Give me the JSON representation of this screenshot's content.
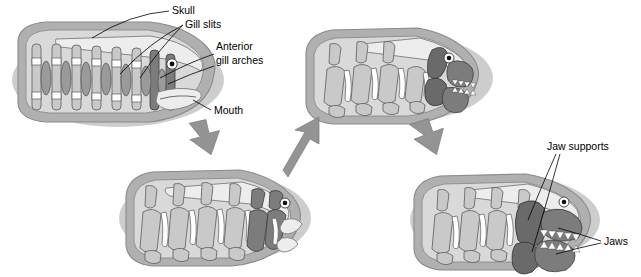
{
  "figure": {
    "type": "scientific-diagram",
    "background_color": "#ffffff",
    "palette": {
      "body_outer": "#b0b0b0",
      "body_inner": "#d9d9d9",
      "skull": "#ededed",
      "arch_light": "#c9c9c9",
      "arch_mid": "#b4b4b4",
      "arch_dark": "#7c7c7c",
      "gill_slit": "#ffffff",
      "arrow": "#949494",
      "label_text": "#000000"
    }
  },
  "labels": [
    {
      "id": "skull",
      "text": "Skull",
      "x": 172,
      "y": 14,
      "anchor": "start"
    },
    {
      "id": "gill-slits",
      "text": "Gill slits",
      "x": 185,
      "y": 28,
      "anchor": "start"
    },
    {
      "id": "anterior-1",
      "text": "Anterior",
      "x": 216,
      "y": 50,
      "anchor": "start"
    },
    {
      "id": "anterior-2",
      "text": "gill arches",
      "x": 216,
      "y": 64,
      "anchor": "start"
    },
    {
      "id": "mouth",
      "text": "Mouth",
      "x": 214,
      "y": 114,
      "anchor": "start"
    },
    {
      "id": "jaw-supports",
      "text": "Jaw supports",
      "x": 547,
      "y": 150,
      "anchor": "start"
    },
    {
      "id": "jaws",
      "text": "Jaws",
      "x": 604,
      "y": 245,
      "anchor": "start"
    }
  ],
  "panels": [
    {
      "id": "panel-1",
      "position": "top-left",
      "stage": 1,
      "caption": "Jawless fish: unjointed anterior gill arches support the open mouth",
      "features": [
        "skull",
        "gill slits",
        "anterior gill arches",
        "mouth"
      ],
      "gill_arch_count": 8,
      "has_jaws": false,
      "has_teeth": false
    },
    {
      "id": "panel-2",
      "position": "top-right",
      "stage": 3,
      "caption": "Anterior arches hinge further, forming functional jaws with small teeth",
      "features": [
        "hinged jaws",
        "teeth"
      ],
      "gill_arch_count": 6,
      "has_jaws": true,
      "has_teeth": true
    },
    {
      "id": "panel-3",
      "position": "bottom-middle",
      "stage": 2,
      "caption": "Foremost gill arches become jointed and angle forward",
      "features": [
        "jointed anterior arches"
      ],
      "gill_arch_count": 7,
      "has_jaws": false,
      "has_teeth": false
    },
    {
      "id": "panel-4",
      "position": "bottom-right",
      "stage": 4,
      "caption": "Modern jawed fish: robust jaws braced by jaw supports, lined with teeth",
      "features": [
        "jaw supports",
        "jaws",
        "tooth row"
      ],
      "gill_arch_count": 5,
      "has_jaws": true,
      "has_teeth": true
    }
  ],
  "arrows": [
    {
      "id": "arrow-1",
      "from": "panel-1",
      "to": "panel-3",
      "direction": "down-right"
    },
    {
      "id": "arrow-2",
      "from": "panel-3",
      "to": "panel-2",
      "direction": "up-right"
    },
    {
      "id": "arrow-3",
      "from": "panel-2",
      "to": "panel-4",
      "direction": "down-right"
    }
  ]
}
